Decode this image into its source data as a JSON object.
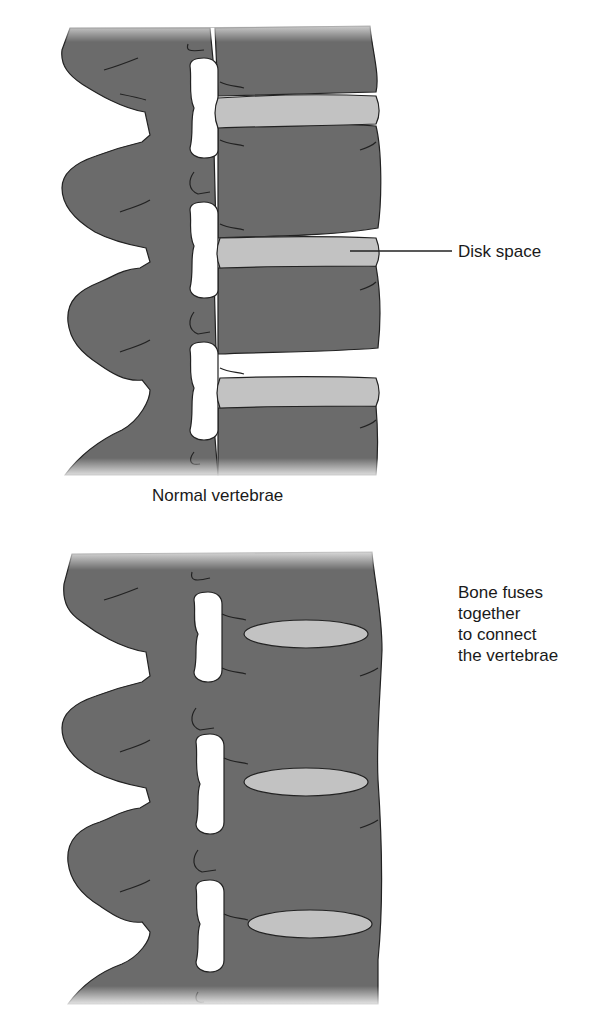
{
  "diagram": {
    "colors": {
      "bone": "#6b6b6b",
      "disk": "#c2c2c2",
      "outline": "#222222",
      "background": "#ffffff",
      "text": "#1a1a1a"
    },
    "panels": [
      {
        "id": "normal",
        "caption": "Normal vertebrae",
        "callout": "Disk space",
        "disk_count": 3,
        "disk_shape": "band"
      },
      {
        "id": "fused",
        "caption": "",
        "callout_lines": [
          "Bone fuses",
          "together",
          "to connect",
          "the vertebrae"
        ],
        "disk_count": 3,
        "disk_shape": "ellipse"
      }
    ]
  }
}
